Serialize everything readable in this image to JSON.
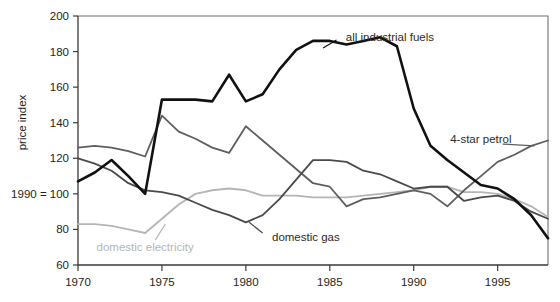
{
  "chart_data": {
    "type": "line",
    "title": "",
    "subtitle": "",
    "xlabel": "",
    "ylabel": "price index",
    "y_base_note": "1990 = 100",
    "xlim": [
      1970,
      1998
    ],
    "ylim": [
      60,
      200
    ],
    "grid": false,
    "legend_position": "inline-annotations",
    "x_ticks": [
      "1970",
      "1975",
      "1980",
      "1985",
      "1990",
      "1995"
    ],
    "x_tick_values": [
      1970,
      1975,
      1980,
      1985,
      1990,
      1995
    ],
    "y_ticks": [
      "60",
      "80",
      "1990 = 100",
      "120",
      "140",
      "160",
      "180",
      "200"
    ],
    "y_tick_values": [
      60,
      80,
      100,
      120,
      140,
      160,
      180,
      200
    ],
    "x": [
      1970,
      1971,
      1972,
      1973,
      1974,
      1975,
      1976,
      1977,
      1978,
      1979,
      1980,
      1981,
      1982,
      1983,
      1984,
      1985,
      1986,
      1987,
      1988,
      1989,
      1990,
      1991,
      1992,
      1993,
      1994,
      1995,
      1996,
      1997,
      1998
    ],
    "series": [
      {
        "name": "all industrial fuels",
        "color": "#111111",
        "width": 2.6,
        "label_x": 1985.6,
        "label_y": 188,
        "values": [
          107,
          112,
          119,
          110,
          100,
          153,
          153,
          153,
          152,
          167,
          152,
          156,
          170,
          181,
          186,
          186,
          184,
          186,
          188,
          183,
          148,
          127,
          119,
          112,
          105,
          103,
          97,
          88,
          75
        ]
      },
      {
        "name": "domestic gas",
        "color": "#4a4a4a",
        "width": 1.8,
        "label_x": 1981.2,
        "label_y": 76,
        "values": [
          120,
          117,
          113,
          106,
          102,
          101,
          99,
          95,
          91,
          88,
          84,
          88,
          97,
          108,
          119,
          119,
          118,
          113,
          111,
          107,
          103,
          104,
          104,
          96,
          98,
          99,
          96,
          90,
          86
        ]
      },
      {
        "name": "4-star petrol",
        "color": "#5e5e5e",
        "width": 1.8,
        "label_x": 1994.0,
        "label_y": 131,
        "values": [
          126,
          127,
          126,
          124,
          121,
          144,
          135,
          131,
          126,
          123,
          138,
          130,
          122,
          114,
          106,
          104,
          93,
          97,
          98,
          100,
          102,
          100,
          93,
          102,
          110,
          118,
          122,
          127,
          130
        ]
      },
      {
        "name": "domestic electricity",
        "color": "#b5b5b5",
        "width": 1.9,
        "label_x": 1974.0,
        "label_y": 70,
        "values": [
          83,
          83,
          82,
          80,
          78,
          86,
          94,
          100,
          102,
          103,
          102,
          99,
          99,
          99,
          98,
          98,
          98,
          99,
          100,
          101,
          102,
          104,
          104,
          101,
          101,
          100,
          97,
          93,
          87
        ]
      }
    ],
    "annotations": [
      {
        "text": "all industrial fuels",
        "color": "#231f20"
      },
      {
        "text": "4-star petrol",
        "color": "#4a4a4a"
      },
      {
        "text": "domestic gas",
        "color": "#4a4a4a"
      },
      {
        "text": "domestic electricity",
        "color": "#b5b5b5"
      }
    ]
  },
  "footer": {
    "cut_text": ""
  }
}
